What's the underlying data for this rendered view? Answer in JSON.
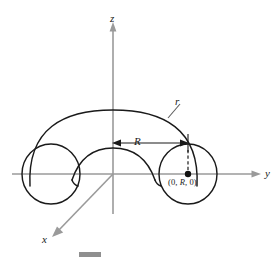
{
  "figure": {
    "kind": "3d-geometry-diagram",
    "background_color": "#ffffff",
    "axis_color": "#9a9a9a",
    "curve_color": "#1a1a1a",
    "labels": {
      "z_axis": "z",
      "y_axis": "y",
      "x_axis": "x",
      "minor_radius": "r",
      "major_radius": "R",
      "center_point_prefix": "(0, ",
      "center_point_var": "R",
      "center_point_suffix": ", 0)",
      "center_point_full": "(0, R, 0)"
    },
    "annotations": {
      "major_radius_note": "double-headed arrow from z-axis to tube center at y = R",
      "minor_radius_note": "leader line pointing to outer torus curve",
      "center_dot_note": "filled dot marking the tube center at (0, R, 0)",
      "dashed_note": "dashed vertical line from R dimension line down to center dot"
    },
    "scale_bar": {
      "visible": true,
      "color": "#8f8f8f"
    }
  }
}
